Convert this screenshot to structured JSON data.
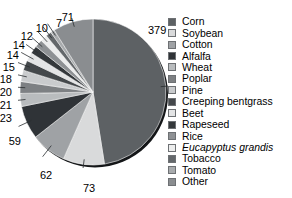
{
  "title": {
    "text": "Total number of trials",
    "value": "798"
  },
  "chart_data": {
    "type": "pie",
    "title": "Total number of trials",
    "xlabel": "",
    "ylabel": "",
    "total": 798,
    "legend_position": "right",
    "grid": false,
    "categories": [
      "Corn",
      "Soybean",
      "Cotton",
      "Alfalfa",
      "Wheat",
      "Poplar",
      "Pine",
      "Creeping bentgrass",
      "Beet",
      "Rapeseed",
      "Rice",
      "Eucapyptus grandis",
      "Tobacco",
      "Tomato",
      "Other"
    ],
    "values": [
      379,
      73,
      62,
      59,
      23,
      21,
      20,
      18,
      15,
      14,
      14,
      12,
      10,
      7,
      71
    ],
    "colors": [
      "#5d6164",
      "#d9dadb",
      "#9fa2a5",
      "#2f3337",
      "#b9bcbe",
      "#7d8083",
      "#c9cbcd",
      "#44484b",
      "#e3e4e5",
      "#34383b",
      "#8e9194",
      "#eceded",
      "#64686b",
      "#a8abad",
      "#8a8d90"
    ]
  },
  "slice_labels": [
    {
      "value": "379"
    },
    {
      "value": "73"
    },
    {
      "value": "62"
    },
    {
      "value": "59"
    },
    {
      "value": "23"
    },
    {
      "value": "21"
    },
    {
      "value": "20"
    },
    {
      "value": "18"
    },
    {
      "value": "15"
    },
    {
      "value": "14"
    },
    {
      "value": "14"
    },
    {
      "value": "12"
    },
    {
      "value": "10"
    },
    {
      "value": "7"
    },
    {
      "value": "71"
    }
  ],
  "legend": {
    "items": [
      {
        "label": "Corn",
        "color": "#5d6164"
      },
      {
        "label": "Soybean",
        "color": "#d9dadb"
      },
      {
        "label": "Cotton",
        "color": "#9fa2a5"
      },
      {
        "label": "Alfalfa",
        "color": "#2f3337"
      },
      {
        "label": "Wheat",
        "color": "#b9bcbe"
      },
      {
        "label": "Poplar",
        "color": "#7d8083"
      },
      {
        "label": "Pine",
        "color": "#c9cbcd"
      },
      {
        "label": "Creeping bentgrass",
        "color": "#44484b"
      },
      {
        "label": "Beet",
        "color": "#e3e4e5"
      },
      {
        "label": "Rapeseed",
        "color": "#34383b"
      },
      {
        "label": "Rice",
        "color": "#8e9194"
      },
      {
        "label": "Eucapyptus grandis",
        "color": "#eceded",
        "italic": true
      },
      {
        "label": "Tobacco",
        "color": "#64686b"
      },
      {
        "label": "Tomato",
        "color": "#a8abad"
      },
      {
        "label": "Other",
        "color": "#8a8d90"
      }
    ]
  }
}
